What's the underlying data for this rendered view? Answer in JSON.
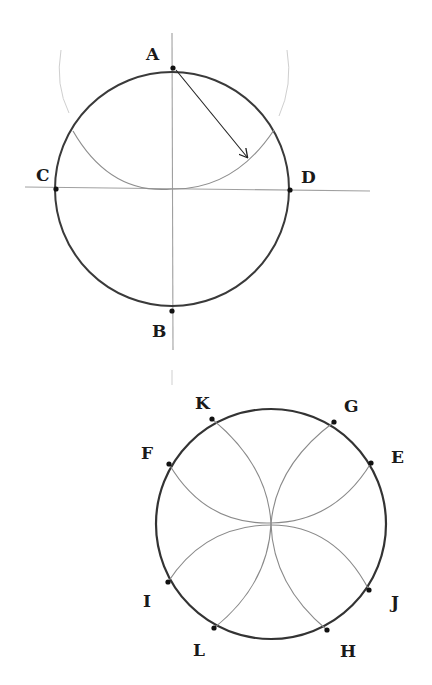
{
  "figure_top": {
    "title": "Circle with perpendicular diameters and arc from A",
    "labels": {
      "A": "A",
      "B": "B",
      "C": "C",
      "D": "D"
    },
    "circle": {
      "cx": 172,
      "cy": 189,
      "r": 117
    },
    "points": {
      "A": [
        173,
        68
      ],
      "B": [
        172,
        311
      ],
      "C": [
        56,
        189
      ],
      "D": [
        290,
        190
      ]
    },
    "arrow": {
      "from": "A",
      "to_point": [
        248,
        158
      ],
      "meaning": "compass radius"
    }
  },
  "figure_bottom": {
    "title": "Circle divided with four intersecting arcs",
    "labels": {
      "K": "K",
      "G": "G",
      "E": "E",
      "F": "F",
      "I": "I",
      "J": "J",
      "L": "L",
      "H": "H"
    },
    "circle": {
      "cx": 271,
      "cy": 524,
      "r": 115
    },
    "points": {
      "K": [
        212,
        419
      ],
      "G": [
        334,
        422
      ],
      "E": [
        371,
        463
      ],
      "F": [
        169,
        464
      ],
      "I": [
        168,
        582
      ],
      "J": [
        369,
        590
      ],
      "L": [
        214,
        628
      ],
      "H": [
        327,
        630
      ]
    }
  },
  "colors": {
    "circle_stroke": "#3a3a3a",
    "construction_line": "#9a9a9a",
    "arc_stroke": "#8a8a8a",
    "faint_arc": "#c8c8c8",
    "point_fill": "#111111",
    "label": "#1a1a1a"
  }
}
